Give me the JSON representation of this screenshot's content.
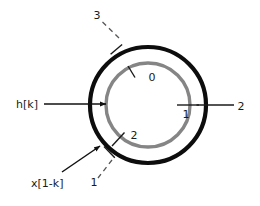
{
  "figure": {
    "background_color": "#ffffff",
    "width": 260,
    "height": 206
  },
  "rings": {
    "outer": {
      "name": "x[1-k] ring",
      "color": "#0d0d0d",
      "stroke_width": 4.2,
      "center_x": 148,
      "center_y": 105,
      "radius": 58
    },
    "inner": {
      "name": "h[k] ring",
      "color": "#858585",
      "stroke_width": 3.4,
      "center_x": 148,
      "center_y": 105,
      "radius": 42
    }
  },
  "outer_ticks": [
    {
      "id": "outer-tick-3",
      "label": "3",
      "label_x": 97,
      "label_y": 19,
      "tick_angle_deg": 230,
      "label_leader": true
    },
    {
      "id": "outer-tick-2",
      "label": "2",
      "label_x": 241,
      "label_y": 110,
      "tick_angle_deg": 0,
      "label_leader": false
    },
    {
      "id": "outer-tick-1",
      "label": "1",
      "label_x": 94,
      "label_y": 186,
      "tick_angle_deg": 131,
      "label_leader": true
    }
  ],
  "inner_ticks": [
    {
      "id": "inner-tick-0",
      "label": "0",
      "label_x": 152,
      "label_y": 81,
      "tick_angle_deg": 249
    },
    {
      "id": "inner-tick-1",
      "label": "1",
      "label_x": 186,
      "label_y": 122,
      "tick_angle_deg": 0
    },
    {
      "id": "inner-tick-2",
      "label": "2",
      "label_x": 134,
      "label_y": 139,
      "tick_angle_deg": 125
    }
  ],
  "signals": [
    {
      "id": "signal-hk",
      "label": "h[k]",
      "label_x": 16,
      "label_y": 108,
      "arrow": {
        "x1": 44,
        "y1": 104,
        "x2": 108,
        "y2": 104,
        "style": "straight"
      }
    },
    {
      "id": "signal-x1k",
      "label": "x[1-k]",
      "label_x": 31,
      "label_y": 183,
      "arrow": {
        "x1": 62,
        "y1": 171,
        "x2": 97,
        "y2": 148,
        "style": "diagonal"
      }
    }
  ],
  "colors": {
    "outer_ring": "#0d0d0d",
    "inner_ring": "#858585",
    "text": "#1a1a1a",
    "leader": "#555555",
    "arrow": "#111111"
  }
}
